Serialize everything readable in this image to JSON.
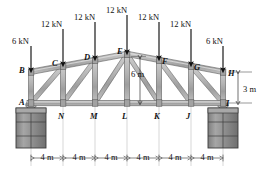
{
  "figure": {
    "kind": "truss-free-body-diagram"
  },
  "colors": {
    "member_fill": "#b0b0b0",
    "member_edge": "#4a4a4a",
    "member_highlight": "#d8d8d8",
    "support_fill": "#909090",
    "support_edge": "#3c3c3c",
    "arrow": "#111111",
    "dimension_line": "#9a9a9a",
    "text": "#111111"
  },
  "loads": [
    {
      "id": "load-B",
      "label": "6 kN",
      "joint": "B",
      "x": 31,
      "label_x": 12,
      "label_y": 37,
      "tail_y": 46,
      "tip_y": 70
    },
    {
      "id": "load-C",
      "label": "12 kN",
      "joint": "C",
      "x": 63,
      "label_x": 41,
      "label_y": 20,
      "tail_y": 29,
      "tip_y": 64
    },
    {
      "id": "load-D",
      "label": "12 kN",
      "joint": "D",
      "x": 95,
      "label_x": 74,
      "label_y": 13,
      "tail_y": 22,
      "tip_y": 58
    },
    {
      "id": "load-E",
      "label": "12 kN",
      "joint": "E",
      "x": 127,
      "label_x": 106,
      "label_y": 6,
      "tail_y": 15,
      "tip_y": 52
    },
    {
      "id": "load-F",
      "label": "12 kN",
      "joint": "F",
      "x": 159,
      "label_x": 138,
      "label_y": 13,
      "tail_y": 22,
      "tip_y": 58
    },
    {
      "id": "load-G",
      "label": "12 kN",
      "joint": "G",
      "x": 191,
      "label_x": 170,
      "label_y": 20,
      "tail_y": 29,
      "tip_y": 64
    },
    {
      "id": "load-H",
      "label": "6 kN",
      "joint": "H",
      "x": 223,
      "label_x": 206,
      "label_y": 37,
      "tail_y": 46,
      "tip_y": 70
    }
  ],
  "joints": {
    "top": [
      {
        "name": "B",
        "label": "B",
        "x": 31,
        "y": 72,
        "label_x": 19,
        "label_y": 66
      },
      {
        "name": "C",
        "label": "C",
        "x": 63,
        "y": 66,
        "label_x": 52,
        "label_y": 59
      },
      {
        "name": "D",
        "label": "D",
        "x": 95,
        "y": 60,
        "label_x": 84,
        "label_y": 53
      },
      {
        "name": "E",
        "label": "E",
        "x": 127,
        "y": 54,
        "label_x": 117,
        "label_y": 47
      },
      {
        "name": "F",
        "label": "F",
        "x": 159,
        "y": 60,
        "label_x": 162,
        "label_y": 57
      },
      {
        "name": "G",
        "label": "G",
        "x": 191,
        "y": 66,
        "label_x": 194,
        "label_y": 63
      },
      {
        "name": "H",
        "label": "H",
        "x": 223,
        "y": 72,
        "label_x": 228,
        "label_y": 69
      }
    ],
    "bottom": [
      {
        "name": "A",
        "label": "A",
        "x": 31,
        "y": 103,
        "label_x": 19,
        "label_y": 98
      },
      {
        "name": "N",
        "label": "N",
        "x": 63,
        "y": 103,
        "label_x": 58,
        "label_y": 112
      },
      {
        "name": "M",
        "label": "M",
        "x": 95,
        "y": 103,
        "label_x": 90,
        "label_y": 112
      },
      {
        "name": "L",
        "label": "L",
        "x": 127,
        "y": 103,
        "label_x": 122,
        "label_y": 112
      },
      {
        "name": "K",
        "label": "K",
        "x": 159,
        "y": 103,
        "label_x": 154,
        "label_y": 112
      },
      {
        "name": "J",
        "label": "J",
        "x": 191,
        "y": 103,
        "label_x": 186,
        "label_y": 112
      },
      {
        "name": "I",
        "label": "I",
        "x": 223,
        "y": 103,
        "label_x": 226,
        "label_y": 99
      }
    ]
  },
  "dimensions": {
    "panel_label": "4 m",
    "panels": [
      {
        "label": "4 m",
        "x1": 31,
        "x2": 63,
        "center_x": 47
      },
      {
        "label": "4 m",
        "x1": 63,
        "x2": 95,
        "center_x": 79
      },
      {
        "label": "4 m",
        "x1": 95,
        "x2": 127,
        "center_x": 111
      },
      {
        "label": "4 m",
        "x1": 127,
        "x2": 159,
        "center_x": 143
      },
      {
        "label": "4 m",
        "x1": 159,
        "x2": 191,
        "center_x": 175
      },
      {
        "label": "4 m",
        "x1": 191,
        "x2": 223,
        "center_x": 207
      }
    ],
    "dim_line_y": 158,
    "height_center": {
      "label": "6 m",
      "label_x": 131,
      "label_y": 70,
      "x": 140,
      "y_top": 57,
      "y_bottom": 103
    },
    "height_end": {
      "label": "3 m",
      "label_x": 243,
      "label_y": 85,
      "x": 238,
      "y_top": 72,
      "y_bottom": 103
    }
  },
  "supports": [
    {
      "id": "support-left",
      "joint": "A",
      "x": 31,
      "y": 106,
      "width": 30,
      "height": 40
    },
    {
      "id": "support-right",
      "joint": "I",
      "x": 223,
      "y": 106,
      "width": 30,
      "height": 40
    }
  ]
}
